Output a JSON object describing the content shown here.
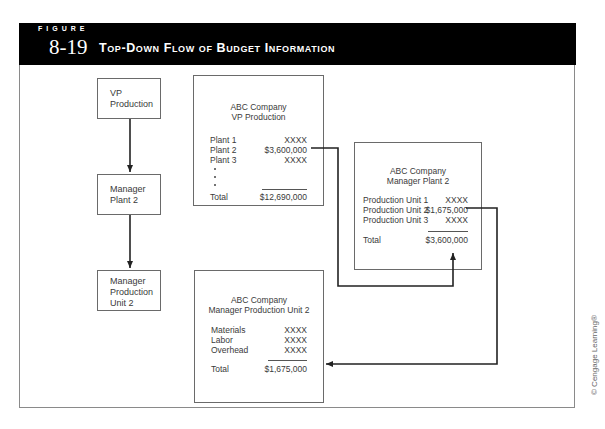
{
  "figure": {
    "label": "FIGURE",
    "number": "8-19",
    "title": "Top-Down Flow of Budget Information"
  },
  "hierarchy": [
    {
      "id": "vp",
      "lines": [
        "VP",
        "Production"
      ]
    },
    {
      "id": "plant",
      "lines": [
        "Manager",
        "Plant 2"
      ]
    },
    {
      "id": "unit",
      "lines": [
        "Manager",
        "Production",
        "Unit 2"
      ]
    }
  ],
  "budgets": {
    "vp": {
      "company": "ABC Company",
      "subtitle": "VP Production",
      "rows": [
        {
          "label": "Plant 1",
          "value": "XXXX"
        },
        {
          "label": "Plant 2",
          "value": "$3,600,000"
        },
        {
          "label": "Plant 3",
          "value": "XXXX"
        }
      ],
      "total_label": "Total",
      "total_value": "$12,690,000"
    },
    "plant": {
      "company": "ABC Company",
      "subtitle": "Manager Plant 2",
      "rows": [
        {
          "label": "Production Unit 1",
          "value": "XXXX"
        },
        {
          "label": "Production Unit 2",
          "value": "$1,675,000"
        },
        {
          "label": "Production Unit 3",
          "value": "XXXX"
        }
      ],
      "total_label": "Total",
      "total_value": "$3,600,000"
    },
    "unit": {
      "company": "ABC Company",
      "subtitle": "Manager Production Unit 2",
      "rows": [
        {
          "label": "Materials",
          "value": "XXXX"
        },
        {
          "label": "Labor",
          "value": "XXXX"
        },
        {
          "label": "Overhead",
          "value": "XXXX"
        }
      ],
      "total_label": "Total",
      "total_value": "$1,675,000"
    }
  },
  "credit": "© Cengage Learning®"
}
